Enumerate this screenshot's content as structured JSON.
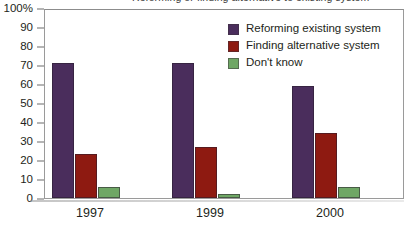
{
  "chart_data": {
    "type": "bar",
    "title": "Reforming or finding alternative to existing system",
    "title_cropped": true,
    "xlabel": "",
    "ylabel": "",
    "ylim": [
      0,
      100
    ],
    "yticks": [
      0,
      10,
      20,
      30,
      40,
      50,
      60,
      70,
      80,
      90,
      100
    ],
    "ytick_labels": [
      "0",
      "10",
      "20",
      "30",
      "40",
      "50",
      "60",
      "70",
      "80",
      "90",
      "100%"
    ],
    "grid": false,
    "legend_position": "top-right",
    "categories": [
      "1997",
      "1999",
      "2000"
    ],
    "series": [
      {
        "name": "Reforming existing system",
        "color": "#4a2d5c",
        "values": [
          71,
          71,
          59
        ]
      },
      {
        "name": "Finding alternative system",
        "color": "#8e1a11",
        "values": [
          23,
          27,
          34
        ]
      },
      {
        "name": "Don't know",
        "color": "#6fa765",
        "values": [
          6,
          2,
          6
        ]
      }
    ]
  },
  "colors": {
    "series_purple": "#4a2d5c",
    "series_red": "#8e1a11",
    "series_green": "#6fa765",
    "axis": "#6d6d6d",
    "frame": "#9a9a9a",
    "text": "#231f20",
    "background": "#ffffff"
  }
}
